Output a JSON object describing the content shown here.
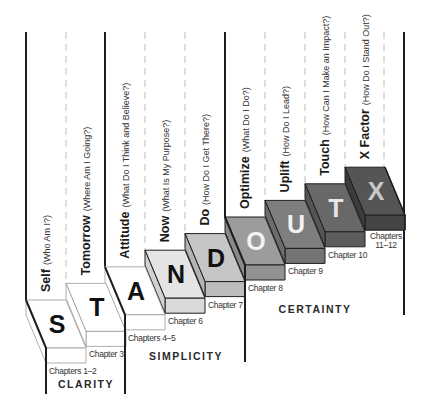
{
  "diagram": {
    "steps": [
      {
        "letter": "S",
        "word": "Self",
        "question": "(Who Am I?)",
        "chapter": "Chapters 1–2",
        "top_color": "#ffffff",
        "front_color": "#ffffff",
        "side_color": "#ffffff",
        "letter_color": "#111111",
        "column_line": "solid"
      },
      {
        "letter": "T",
        "word": "Tomorrow",
        "question": "(Where Am I Going?)",
        "chapter": "Chapter 3",
        "top_color": "#ffffff",
        "front_color": "#ffffff",
        "side_color": "#ffffff",
        "letter_color": "#111111",
        "column_line": "dashed"
      },
      {
        "letter": "A",
        "word": "Attitude",
        "question": "(What Do I Think and Believe?)",
        "chapter": "Chapters 4–5",
        "top_color": "#ffffff",
        "front_color": "#ffffff",
        "side_color": "#ffffff",
        "letter_color": "#111111",
        "column_line": "solid"
      },
      {
        "letter": "N",
        "word": "Now",
        "question": "(What Is My Purpose?)",
        "chapter": "Chapter 6",
        "top_color": "#e4e4e4",
        "front_color": "#dadada",
        "side_color": "#d2d2d2",
        "letter_color": "#111111",
        "column_line": "dashed"
      },
      {
        "letter": "D",
        "word": "Do",
        "question": "(How Do I Get There?)",
        "chapter": "Chapter 7",
        "top_color": "#c6c6c6",
        "front_color": "#bcbcbc",
        "side_color": "#b4b4b4",
        "letter_color": "#111111",
        "column_line": "dashed"
      },
      {
        "letter": "O",
        "word": "Optimize",
        "question": "(What Do I Do?)",
        "chapter": "Chapter 8",
        "top_color": "#9c9c9c",
        "front_color": "#929292",
        "side_color": "#8a8a8a",
        "letter_color": "#f2f2f2",
        "column_line": "solid"
      },
      {
        "letter": "U",
        "word": "Uplift",
        "question": "(How Do I Lead?)",
        "chapter": "Chapter 9",
        "top_color": "#7e7e7e",
        "front_color": "#747474",
        "side_color": "#6c6c6c",
        "letter_color": "#f2f2f2",
        "column_line": "dashed"
      },
      {
        "letter": "T",
        "word": "Touch",
        "question": "(How Can I Make an Impact?)",
        "chapter": "Chapter 10",
        "top_color": "#686868",
        "front_color": "#5c5c5c",
        "side_color": "#555555",
        "letter_color": "#e6e6e6",
        "column_line": "dashed"
      },
      {
        "letter": "X",
        "word": "X Factor",
        "question": "(How Do I Stand Out?)",
        "chapter": "Chapters 11–12",
        "top_color": "#555555",
        "front_color": "#444444",
        "side_color": "#3c3c3c",
        "letter_color": "#c8c8c8",
        "column_line": "dashed"
      }
    ],
    "phases": [
      {
        "label": "CLARITY",
        "from_step": 0,
        "to_step": 1
      },
      {
        "label": "SIMPLICITY",
        "from_step": 2,
        "to_step": 4
      },
      {
        "label": "CERTAINTY",
        "from_step": 5,
        "to_step": 8
      }
    ],
    "colors": {
      "line": "#1e1e1e",
      "dashed_line": "#bdbdbd",
      "outline_light": "#9a9a9a"
    }
  }
}
